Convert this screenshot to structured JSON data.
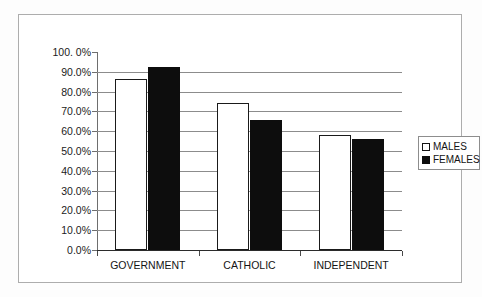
{
  "chart_data": {
    "type": "bar",
    "title": "",
    "xlabel": "",
    "ylabel": "",
    "categories": [
      "GOVERNMENT",
      "CATHOLIC",
      "INDEPENDENT"
    ],
    "series": [
      {
        "name": "MALES",
        "values": [
          86.5,
          74.5,
          58.3
        ]
      },
      {
        "name": "FEMALES",
        "values": [
          92.5,
          65.8,
          56.0
        ]
      }
    ],
    "ylim": [
      0,
      100
    ],
    "ytick_values": [
      0,
      10,
      20,
      30,
      40,
      50,
      60,
      70,
      80,
      90,
      100
    ],
    "ytick_labels": [
      "0.0%",
      "10.0%",
      "20.0%",
      "30.0%",
      "40.0%",
      "50.0%",
      "60.0%",
      "70.0%",
      "80.0%",
      "90.0%",
      "100. 0%"
    ],
    "grid": true,
    "legend_position": "right",
    "series_colors": {
      "MALES": "#ffffff",
      "FEMALES": "#0d0d0d"
    },
    "outline_color": "#1a1a1a",
    "gridline_color": "#8c8c8c",
    "axis_color": "#2b2b2b"
  },
  "legend": {
    "items": [
      {
        "label": "MALES",
        "swatch": "open-square-swatch"
      },
      {
        "label": "FEMALES",
        "swatch": "filled-square-swatch"
      }
    ]
  },
  "axis": {
    "y_labels": [
      "100. 0%",
      "90.0%",
      "80.0%",
      "70.0%",
      "60.0%",
      "50.0%",
      "40.0%",
      "30.0%",
      "20.0%",
      "10.0%",
      "0.0%"
    ],
    "x_labels": [
      "GOVERNMENT",
      "CATHOLIC",
      "INDEPENDENT"
    ]
  }
}
